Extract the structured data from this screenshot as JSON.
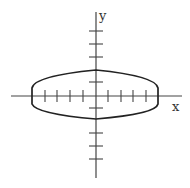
{
  "diagram": {
    "type": "ellipse-on-axes",
    "axes": {
      "x_label": "x",
      "y_label": "y",
      "x_ticks_per_side": 4,
      "y_ticks_per_side": 5
    },
    "shape": {
      "name": "ellipse",
      "semi_major_axis_ticks": 5,
      "semi_minor_axis_ticks": 2
    },
    "colors": {
      "line": "#222222",
      "axis": "#444444",
      "background": "#ffffff"
    }
  }
}
